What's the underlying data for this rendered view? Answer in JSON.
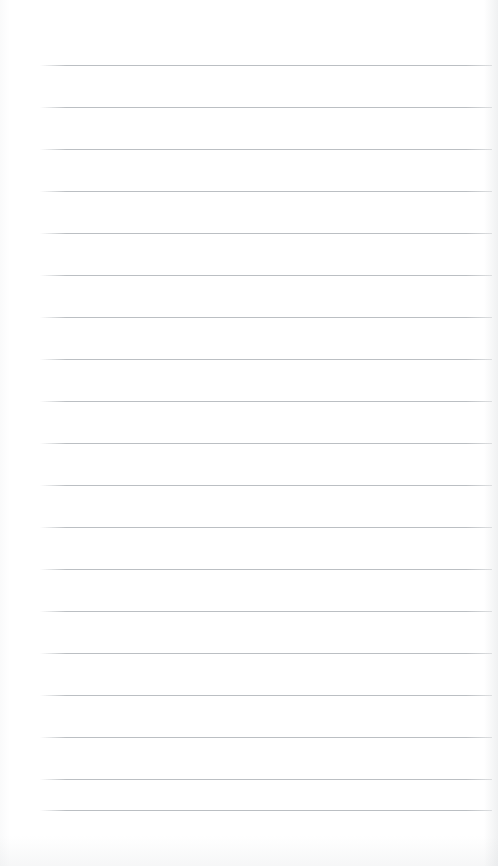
{
  "document": {
    "kind": "scanned-lined-paper",
    "title": "Lined Notepad Page",
    "page_width": 498,
    "page_height": 866,
    "background_color": "#ffffff",
    "text_content": "",
    "handwriting_present": "no",
    "printed_text_present": "no"
  },
  "ruling": {
    "line_color": "#b6babe",
    "line_thickness_px": 1,
    "line_count": 19,
    "line_spacing_px": 42,
    "first_line_y": 65,
    "left_margin_x": 40,
    "right_end_x": 492,
    "line_length_px": 452,
    "vertical_margin_rule": "none",
    "line_y_positions": [
      65,
      107,
      149,
      191,
      233,
      275,
      317,
      359,
      401,
      443,
      485,
      527,
      569,
      611,
      653,
      695,
      737,
      779,
      810
    ]
  },
  "margins": {
    "top_blank_px": 65,
    "bottom_blank_px": 56,
    "left_blank_px": 40,
    "right_blank_px": 6
  },
  "scan_artifacts": {
    "right_edge_shadow": "#cdd0d3",
    "bottom_edge_shadow": "#d6d9dc",
    "left_edge_shadow": "#e2e4e6"
  }
}
